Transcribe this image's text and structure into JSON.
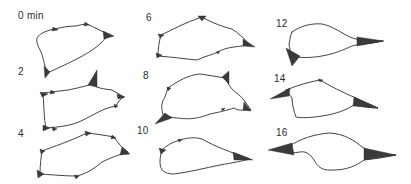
{
  "figure": {
    "time_unit": "min",
    "panels": [
      {
        "id": "t0",
        "label": "0 min",
        "time": 0
      },
      {
        "id": "t2",
        "label": "2",
        "time": 2
      },
      {
        "id": "t4",
        "label": "4",
        "time": 4
      },
      {
        "id": "t6",
        "label": "6",
        "time": 6
      },
      {
        "id": "t8",
        "label": "8",
        "time": 8
      },
      {
        "id": "t10",
        "label": "10",
        "time": 10
      },
      {
        "id": "t12",
        "label": "12",
        "time": 12
      },
      {
        "id": "t14",
        "label": "14",
        "time": 14
      },
      {
        "id": "t16",
        "label": "16",
        "time": 16
      }
    ]
  },
  "colors": {
    "background": "#ffffff",
    "ink": "#2e2e2e"
  }
}
